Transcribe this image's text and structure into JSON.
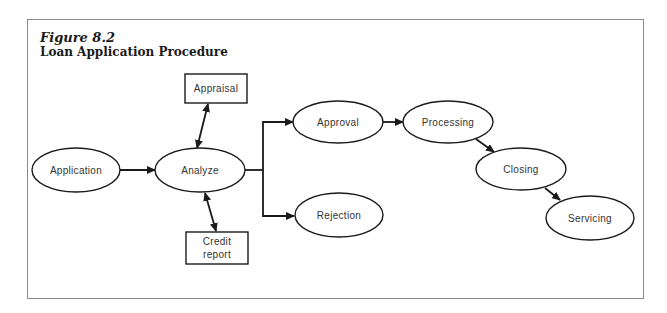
{
  "figure": {
    "label": "Figure 8.2",
    "title": "Loan Application Procedure"
  },
  "nodes": {
    "application": {
      "label": "Application",
      "shape": "ellipse"
    },
    "analyze": {
      "label": "Analyze",
      "shape": "ellipse"
    },
    "appraisal": {
      "label": "Appraisal",
      "shape": "rectangle"
    },
    "credit_report": {
      "line1": "Credit",
      "line2": "report",
      "shape": "rectangle"
    },
    "approval": {
      "label": "Approval",
      "shape": "ellipse"
    },
    "rejection": {
      "label": "Rejection",
      "shape": "ellipse"
    },
    "processing": {
      "label": "Processing",
      "shape": "ellipse"
    },
    "closing": {
      "label": "Closing",
      "shape": "ellipse"
    },
    "servicing": {
      "label": "Servicing",
      "shape": "ellipse"
    }
  },
  "edges": [
    {
      "from": "Application",
      "to": "Analyze",
      "type": "one-way"
    },
    {
      "from": "Analyze",
      "to": "Appraisal",
      "type": "two-way"
    },
    {
      "from": "Analyze",
      "to": "Credit report",
      "type": "two-way"
    },
    {
      "from": "Analyze",
      "to": "Approval",
      "type": "one-way"
    },
    {
      "from": "Analyze",
      "to": "Rejection",
      "type": "one-way"
    },
    {
      "from": "Approval",
      "to": "Processing",
      "type": "one-way"
    },
    {
      "from": "Processing",
      "to": "Closing",
      "type": "one-way"
    },
    {
      "from": "Closing",
      "to": "Servicing",
      "type": "one-way"
    }
  ],
  "colors": {
    "stroke": "#1a1a1a",
    "text": "#333333",
    "frame": "#8a8a8a"
  }
}
